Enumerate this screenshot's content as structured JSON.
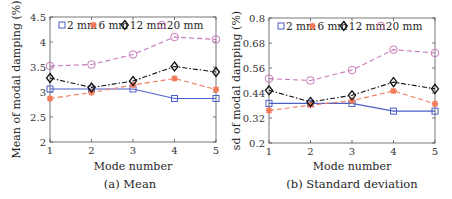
{
  "chart_data": [
    {
      "type": "line",
      "title": "",
      "caption": "(a) Mean",
      "xlabel": "Mode number",
      "ylabel": "Mean of modal damping (%)",
      "x": [
        1,
        2,
        3,
        4,
        5
      ],
      "xticks": [
        "1",
        "2",
        "3",
        "4",
        "5"
      ],
      "yticks": [
        "2",
        "2.5",
        "3",
        "3.5",
        "4",
        "4.5"
      ],
      "ylim": [
        2,
        4.5
      ],
      "xlim": [
        1,
        5
      ],
      "grid": false,
      "legend_position": "top",
      "series": [
        {
          "name": "2 mm",
          "color": "#4b5fc8",
          "marker": "square",
          "line": "solid",
          "values": [
            3.06,
            3.06,
            3.06,
            2.87,
            2.87
          ]
        },
        {
          "name": "6 mm",
          "color": "#f07a5a",
          "marker": "asterisk",
          "line": "dashed",
          "values": [
            2.87,
            2.99,
            3.14,
            3.27,
            3.05
          ]
        },
        {
          "name": "12 mm",
          "color": "#111111",
          "marker": "diamond",
          "line": "dashdot",
          "values": [
            3.28,
            3.09,
            3.22,
            3.51,
            3.4
          ]
        },
        {
          "name": "20 mm",
          "color": "#c878b8",
          "marker": "circle",
          "line": "dashed",
          "values": [
            3.52,
            3.55,
            3.75,
            4.1,
            4.05
          ]
        }
      ]
    },
    {
      "type": "line",
      "title": "",
      "caption": "(b) Standard deviation",
      "xlabel": "Mode number",
      "ylabel": "sd of modal damping (%)",
      "x": [
        1,
        2,
        3,
        4,
        5
      ],
      "xticks": [
        "1",
        "2",
        "3",
        "4",
        "5"
      ],
      "yticks": [
        "0.2",
        "0.32",
        "0.44",
        "0.56",
        "0.68",
        "0.8"
      ],
      "ylim": [
        0.2,
        0.8
      ],
      "xlim": [
        1,
        5
      ],
      "grid": false,
      "legend_position": "top",
      "series": [
        {
          "name": "2 mm",
          "color": "#4b5fc8",
          "marker": "square",
          "line": "solid",
          "values": [
            0.39,
            0.39,
            0.39,
            0.353,
            0.353
          ]
        },
        {
          "name": "6 mm",
          "color": "#f07a5a",
          "marker": "asterisk",
          "line": "dashed",
          "values": [
            0.356,
            0.382,
            0.403,
            0.45,
            0.388
          ]
        },
        {
          "name": "12 mm",
          "color": "#111111",
          "marker": "diamond",
          "line": "dashdot",
          "values": [
            0.453,
            0.397,
            0.429,
            0.492,
            0.46
          ]
        },
        {
          "name": "20 mm",
          "color": "#c878b8",
          "marker": "circle",
          "line": "dashed",
          "values": [
            0.509,
            0.5,
            0.55,
            0.648,
            0.632
          ]
        }
      ]
    }
  ]
}
